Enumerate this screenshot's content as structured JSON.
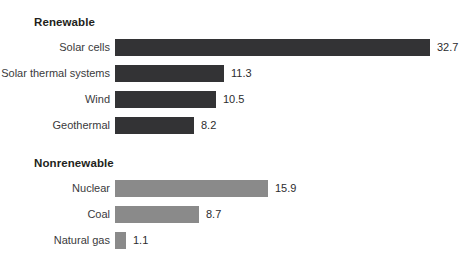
{
  "chart_data": {
    "type": "bar",
    "orientation": "horizontal",
    "title": "",
    "xlabel": "",
    "ylabel": "",
    "grid": false,
    "legend": "none",
    "axis_visible": false,
    "xlim": [
      0,
      32.7
    ],
    "value_precision": 1,
    "colors": {
      "renewable_bar": "#333335",
      "nonrenewable_bar": "#8a8a8a",
      "background": "#ffffff",
      "label_text": "#3a3a3c",
      "value_text": "#2c2c2e",
      "heading_text": "#231f20"
    },
    "groups": [
      {
        "name": "Renewable",
        "heading": "Renewable",
        "color_key": "renewable_bar",
        "categories": [
          "Solar cells",
          "Solar thermal systems",
          "Wind",
          "Geothermal"
        ],
        "values": [
          32.7,
          11.3,
          10.5,
          8.2
        ],
        "value_labels": [
          "32.7",
          "11.3",
          "10.5",
          "8.2"
        ]
      },
      {
        "name": "Nonrenewable",
        "heading": "Nonrenewable",
        "color_key": "nonrenewable_bar",
        "categories": [
          "Nuclear",
          "Coal",
          "Natural gas"
        ],
        "values": [
          15.9,
          8.7,
          1.1
        ],
        "value_labels": [
          "15.9",
          "8.7",
          "1.1"
        ]
      }
    ]
  },
  "layout": {
    "bar_origin_x": 115,
    "px_per_unit": 9.63,
    "bar_height": 17,
    "row_pitch": 26,
    "value_gap": 7,
    "group1_heading_y": 16,
    "group1_first_row_y": 39,
    "group2_heading_y": 157,
    "group2_first_row_y": 180
  }
}
